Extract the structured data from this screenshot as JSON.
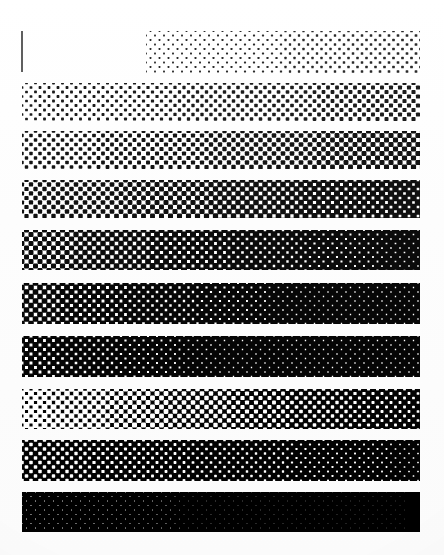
{
  "document": {
    "title": "Halftone Density Step Wedge",
    "description": "Scanned printer tint scale: ten horizontal halftone bands of increasing dot coverage from light to solid black, on white paper.",
    "background_color": "#ffffff",
    "ink_color": "#000000",
    "page_width": 444,
    "page_height": 555
  },
  "tick_mark": {
    "name": "corner-registration-tick",
    "color": "#5f5f5f",
    "x": 21,
    "y": 31,
    "width": 2,
    "height": 41
  },
  "chart_data": {
    "type": "bar",
    "xlabel": "",
    "ylabel": "Step",
    "grid": false,
    "legend": null,
    "categories": [
      "Step 1",
      "Step 2",
      "Step 3",
      "Step 4",
      "Step 5",
      "Step 6",
      "Step 7",
      "Step 8",
      "Step 9",
      "Step 10"
    ],
    "values": [
      6,
      14,
      22,
      32,
      44,
      55,
      65,
      76,
      86,
      97
    ],
    "ylim": [
      0,
      100
    ],
    "units": "percent dot coverage"
  },
  "bands": [
    {
      "index": 1,
      "label": "Step 1",
      "coverage": 6,
      "x": 146,
      "y": 31,
      "width": 274,
      "height": 42,
      "dot_pitch": 9,
      "dot_radius": 1.25,
      "ink": "#2a2a2a",
      "ramp": true
    },
    {
      "index": 2,
      "label": "Step 2",
      "coverage": 14,
      "x": 22,
      "y": 83,
      "width": 398,
      "height": 38,
      "dot_pitch": 9,
      "dot_radius": 1.9,
      "ink": "#1c1c1c",
      "ramp": true
    },
    {
      "index": 3,
      "label": "Step 3",
      "coverage": 22,
      "x": 22,
      "y": 131,
      "width": 398,
      "height": 38,
      "dot_pitch": 9,
      "dot_radius": 2.4,
      "ink": "#141414",
      "ramp": true
    },
    {
      "index": 4,
      "label": "Step 4",
      "coverage": 32,
      "x": 22,
      "y": 180,
      "width": 398,
      "height": 38,
      "dot_pitch": 9,
      "dot_radius": 2.95,
      "ink": "#101010",
      "ramp": true
    },
    {
      "index": 5,
      "label": "Step 5",
      "coverage": 44,
      "x": 22,
      "y": 230,
      "width": 398,
      "height": 40,
      "dot_pitch": 9,
      "dot_radius": 3.45,
      "ink": "#0b0b0b",
      "ramp": true
    },
    {
      "index": 6,
      "label": "Step 6",
      "coverage": 55,
      "x": 22,
      "y": 283,
      "width": 398,
      "height": 41,
      "dot_pitch": 9,
      "dot_radius": 3.85,
      "ink": "#070707",
      "ramp": true
    },
    {
      "index": 7,
      "label": "Step 7",
      "coverage": 65,
      "x": 22,
      "y": 336,
      "width": 398,
      "height": 41,
      "dot_pitch": 9,
      "dot_radius": 4.2,
      "ink": "#050505",
      "ramp": true
    },
    {
      "index": 8,
      "label": "Step 8",
      "coverage": 76,
      "x": 22,
      "y": 389,
      "width": 398,
      "height": 40,
      "dot_pitch": 9,
      "dot_radius": 4.55,
      "ink": "#030303",
      "ramp": false
    },
    {
      "index": 9,
      "label": "Step 9",
      "coverage": 86,
      "x": 22,
      "y": 440,
      "width": 398,
      "height": 41,
      "dot_pitch": 9,
      "dot_radius": 4.95,
      "ink": "#020202",
      "ramp": false
    },
    {
      "index": 10,
      "label": "Step 10",
      "coverage": 97,
      "x": 22,
      "y": 492,
      "width": 398,
      "height": 40,
      "dot_pitch": 9,
      "dot_radius": 6.1,
      "ink": "#000000",
      "ramp": false
    }
  ]
}
